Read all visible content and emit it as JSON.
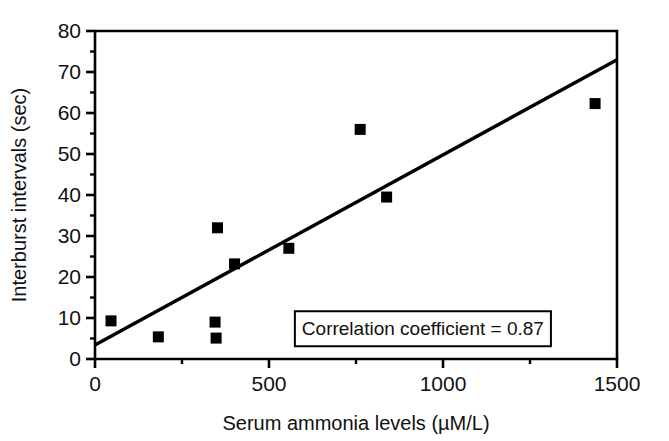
{
  "chart_data": {
    "type": "scatter",
    "title": "",
    "xlabel": "Serum ammonia levels (µM/L)",
    "ylabel": "Interburst intervals (sec)",
    "xlim": [
      0,
      1500
    ],
    "ylim": [
      0,
      80
    ],
    "grid": false,
    "legend": null,
    "x_ticks": [
      0,
      500,
      1000,
      1500
    ],
    "x_tick_labels": [
      "0",
      "500",
      "1000",
      "1500"
    ],
    "x_minor_ticks": [
      250,
      750,
      1250
    ],
    "y_ticks": [
      0,
      10,
      20,
      30,
      40,
      50,
      60,
      70,
      80
    ],
    "y_tick_labels": [
      "0",
      "10",
      "20",
      "30",
      "40",
      "50",
      "60",
      "70",
      "80"
    ],
    "y_minor_ticks": [
      5,
      15,
      25,
      35,
      45,
      55,
      65,
      75
    ],
    "marker": "filled-square",
    "marker_color": "#000000",
    "points": [
      {
        "x": 46,
        "y": 9.3
      },
      {
        "x": 182,
        "y": 5.4
      },
      {
        "x": 345,
        "y": 9.0
      },
      {
        "x": 348,
        "y": 5.1
      },
      {
        "x": 352,
        "y": 32.0
      },
      {
        "x": 401,
        "y": 23.2
      },
      {
        "x": 557,
        "y": 27.0
      },
      {
        "x": 762,
        "y": 56.0
      },
      {
        "x": 838,
        "y": 39.5
      },
      {
        "x": 1437,
        "y": 62.3
      }
    ],
    "trend_line": {
      "type": "linear-regression",
      "x_start": 0,
      "y_start": 3.4,
      "x_end": 1500,
      "y_end": 73.0,
      "color": "#000000"
    },
    "annotations": [
      {
        "name": "correlation-annotation",
        "text": "Correlation coefficient = 0.87",
        "value": 0.87,
        "x": 1290,
        "y": 7.5,
        "boxed": true
      }
    ]
  },
  "axis": {
    "x_title": "Serum ammonia levels (µM/L)",
    "y_title": "Interburst intervals (sec)"
  },
  "annotation": {
    "correlation_text": "Correlation coefficient = 0.87"
  },
  "ticks": {
    "y": [
      "0",
      "10",
      "20",
      "30",
      "40",
      "50",
      "60",
      "70",
      "80"
    ],
    "x": [
      "0",
      "500",
      "1000",
      "1500"
    ]
  },
  "colors": {
    "line": "#000000",
    "marker": "#000000",
    "axis": "#000000",
    "background": "#ffffff"
  }
}
